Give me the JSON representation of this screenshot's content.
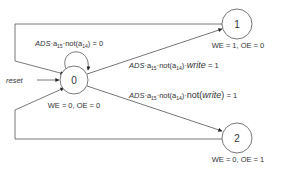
{
  "diagram": {
    "type": "state-machine",
    "colors": {
      "line": "#555555",
      "text": "#333333",
      "background": "#ffffff"
    },
    "states": [
      {
        "id": "0",
        "label": "0",
        "outputs": "WE = 0, OE = 0"
      },
      {
        "id": "1",
        "label": "1",
        "outputs": "WE = 1, OE = 0"
      },
      {
        "id": "2",
        "label": "2",
        "outputs": "WE = 0, OE = 1"
      }
    ],
    "reset": {
      "label": "reset"
    },
    "transitions": {
      "self_loop": {
        "prefix": "ADS",
        "a15": "a",
        "a15_sub": "15",
        "not_open": "not(",
        "a14": "a",
        "a14_sub": "14",
        "not_close": ")",
        "suffix": " = 0"
      },
      "to_1": {
        "prefix": "ADS",
        "a15": "a",
        "a15_sub": "15",
        "not_open": "not(",
        "a14": "a",
        "a14_sub": "14",
        "not_close": ")",
        "dot": "·",
        "write": "write",
        "suffix": " = 1"
      },
      "to_2": {
        "prefix": "ADS",
        "a15": "a",
        "a15_sub": "15",
        "not_open": "not(",
        "a14": "a",
        "a14_sub": "14",
        "not_close": ")",
        "dot": "·",
        "not2_open": "not(",
        "write": "write",
        "not2_close": ")",
        "suffix": " = 1"
      }
    }
  }
}
